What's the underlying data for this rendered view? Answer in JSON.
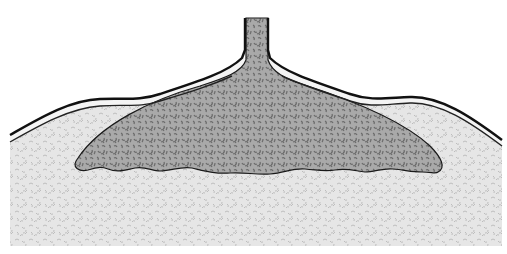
{
  "figure": {
    "type": "geologic-cross-section",
    "parts": [
      {
        "id": "feeder-conduit",
        "label": ""
      },
      {
        "id": "intrusion-body",
        "label": ""
      },
      {
        "id": "host-rock",
        "label": ""
      },
      {
        "id": "overlying-layer",
        "label": ""
      }
    ]
  },
  "colors": {
    "background": "#ffffff",
    "outline": "#1a1a1a",
    "intrusion_base": "#a9a9a9",
    "intrusion_speckle": "#6f6f6f",
    "host_base": "#e6e6e6",
    "host_speckle": "#bdbdbd",
    "layer_band": "#f2f2f2"
  }
}
